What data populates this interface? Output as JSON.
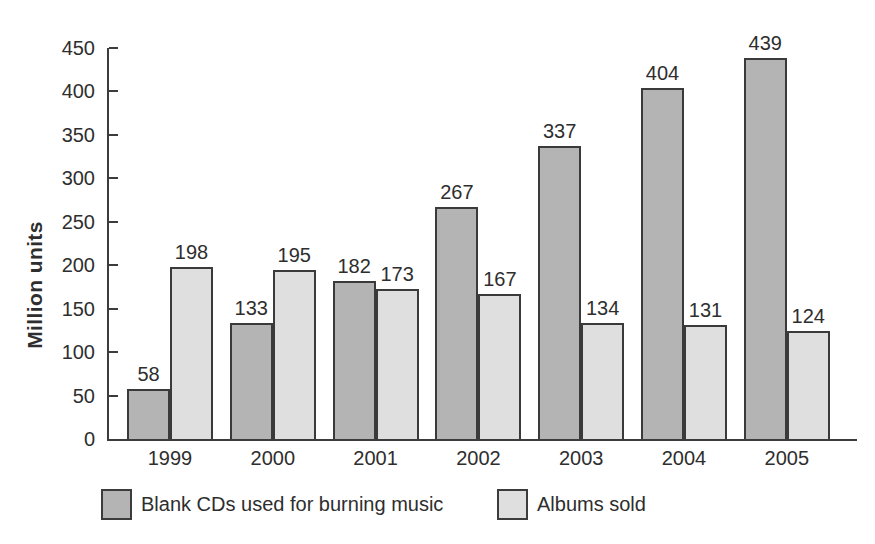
{
  "chart_data": {
    "type": "bar",
    "categories": [
      "1999",
      "2000",
      "2001",
      "2002",
      "2003",
      "2004",
      "2005"
    ],
    "series": [
      {
        "name": "Blank CDs used for burning music",
        "key": "blank-cds",
        "color": "#b4b4b4",
        "values": [
          58,
          133,
          182,
          267,
          337,
          404,
          439
        ]
      },
      {
        "name": "Albums sold",
        "key": "albums-sold",
        "color": "#dfdfdf",
        "values": [
          198,
          195,
          173,
          167,
          134,
          131,
          124
        ]
      }
    ],
    "title": "",
    "xlabel": "",
    "ylabel": "Million units",
    "ylim": [
      0,
      450
    ],
    "yticks": [
      0,
      50,
      100,
      150,
      200,
      250,
      300,
      350,
      400,
      450
    ],
    "grid": false,
    "bar_value_labels": true,
    "legend_position": "bottom"
  },
  "colors": {
    "axis": "#3c3c3c",
    "bar_border": "#3a3a3a",
    "text": "#2e2e2e",
    "background": "#ffffff"
  }
}
